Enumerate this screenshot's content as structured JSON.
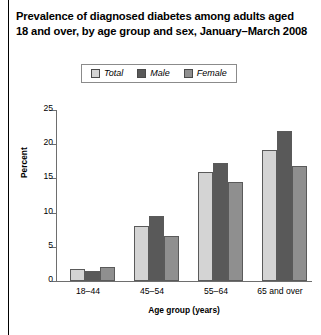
{
  "chart_data": {
    "type": "bar",
    "title": "Prevalence of diagnosed diabetes among adults aged 18 and over, by age group and sex, January–March 2008",
    "xlabel": "Age group (years)",
    "ylabel": "Percent",
    "categories": [
      "18–44",
      "45–54",
      "55–64",
      "65 and over"
    ],
    "series": [
      {
        "name": "Total",
        "values": [
          1.8,
          8.0,
          15.9,
          19.2
        ],
        "color": "#d4d4d4"
      },
      {
        "name": "Male",
        "values": [
          1.5,
          9.5,
          17.3,
          22.0
        ],
        "color": "#595959"
      },
      {
        "name": "Female",
        "values": [
          2.0,
          6.6,
          14.5,
          16.8
        ],
        "color": "#8f8f8f"
      }
    ],
    "ylim": [
      0,
      25
    ],
    "yticks": [
      0,
      5,
      10,
      15,
      20,
      25
    ],
    "ytick_labels": [
      "0",
      "5",
      "10",
      "15",
      "20",
      "25"
    ],
    "grid": false,
    "legend_position": "top-center"
  },
  "colors": {
    "axis": "#6e6e6e",
    "bar_border": "#5a5a5a",
    "legend_border": "#8b8b8b",
    "text": "#000000",
    "page_rule": "#000000"
  }
}
